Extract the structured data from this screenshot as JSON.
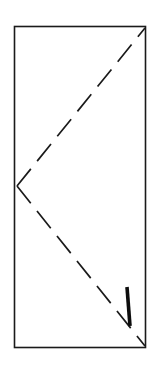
{
  "drawing": {
    "title": "Door Elevation Symbol",
    "type": "architectural-door-symbol",
    "canvas": {
      "width": 160,
      "height": 371,
      "background_color": "#ffffff"
    },
    "door_panel": {
      "name": "door-panel",
      "shape": "rectangle",
      "x": 14.5,
      "y": 26.5,
      "width": 131,
      "height": 321,
      "stroke_color": "#1a1a1a",
      "stroke_width": 1.6,
      "fill_color": "#ffffff"
    },
    "swing_lines": [
      {
        "name": "upper-swing-line",
        "description": "dashed diagonal from hinge vertex up to top-right corner",
        "x1": 17,
        "y1": 186,
        "x2": 145,
        "y2": 28,
        "stroke_color": "#1a1a1a",
        "stroke_width": 1.7,
        "dash_pattern": "22 10"
      },
      {
        "name": "lower-swing-line",
        "description": "dashed diagonal from hinge vertex down to bottom-right corner",
        "x1": 17,
        "y1": 186,
        "x2": 145,
        "y2": 346,
        "stroke_color": "#1a1a1a",
        "stroke_width": 1.7,
        "dash_pattern": "22 10"
      }
    ],
    "hinge_vertex": {
      "name": "hinge-vertex",
      "description": "apex where the two dashed swing lines meet on the hinge edge",
      "x": 17,
      "y": 186
    },
    "handle": {
      "name": "door-handle",
      "description": "bold vertical lever handle mark near the latch edge",
      "x1": 127,
      "y1": 287,
      "x2": 130,
      "y2": 326,
      "stroke_color": "#0d0d0d",
      "stroke_width": 3.6
    },
    "colors": {
      "ink": "#1a1a1a",
      "handle_ink": "#0d0d0d",
      "paper": "#ffffff"
    }
  }
}
